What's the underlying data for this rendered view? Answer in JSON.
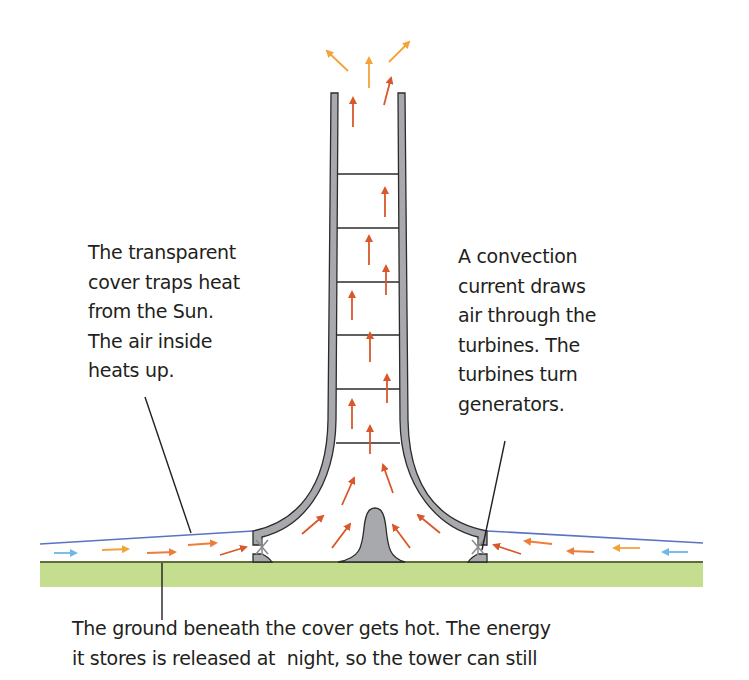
{
  "diagram": {
    "labels": {
      "cover": {
        "lines": [
          "The transparent",
          "cover traps heat",
          "from the Sun.",
          "The air inside",
          "heats up."
        ]
      },
      "turbines": {
        "lines": [
          "A convection",
          "current draws",
          "air through the",
          "turbines. The",
          "turbines turn",
          "generators."
        ]
      },
      "ground": {
        "lines": [
          "The ground beneath the cover gets hot. The energy",
          "it stores is released at  night, so the tower can still"
        ]
      }
    },
    "colors": {
      "tower_fill": "#a7a9ac",
      "tower_outline": "#2b2b2b",
      "ground": "#c5dd8f",
      "ground_line": "#5e6b3a",
      "cover_line": "#5b73c4",
      "arrow_cool": "#6fb7e6",
      "arrow_warm": "#f2a33a",
      "arrow_orange": "#ef7d3a",
      "arrow_hot": "#d9582b",
      "text": "#231f20"
    },
    "parts": [
      "tower",
      "cross-braces",
      "transparent-cover",
      "turbines",
      "ground",
      "central-mound",
      "airflow-arrows"
    ]
  }
}
